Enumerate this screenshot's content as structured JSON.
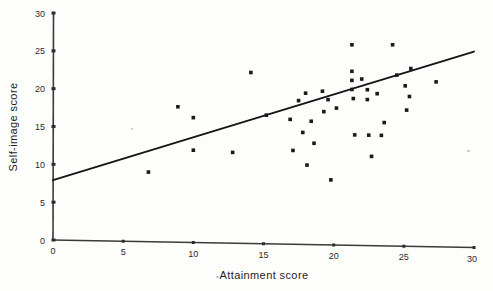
{
  "chart_data": {
    "type": "scatter",
    "title": "",
    "xlabel": "Attainment score",
    "ylabel": "Self-image score",
    "xlim": [
      0,
      30
    ],
    "ylim": [
      0,
      30
    ],
    "xticks": [
      0,
      5,
      10,
      15,
      20,
      25,
      30
    ],
    "yticks": [
      0,
      5,
      10,
      15,
      20,
      25,
      30
    ],
    "xtick_labels": [
      "0",
      "5",
      "10",
      "15",
      "20",
      "25",
      "30"
    ],
    "ytick_labels": [
      "0",
      "5",
      "10",
      "15",
      "20",
      "25",
      "30"
    ],
    "grid": false,
    "legend": null,
    "marker": "square",
    "points": [
      {
        "x": 6.8,
        "y": 9.2
      },
      {
        "x": 8.9,
        "y": 17.9
      },
      {
        "x": 10.0,
        "y": 16.5
      },
      {
        "x": 10.0,
        "y": 12.2
      },
      {
        "x": 12.8,
        "y": 12.0
      },
      {
        "x": 14.1,
        "y": 22.6
      },
      {
        "x": 15.2,
        "y": 17.0
      },
      {
        "x": 16.9,
        "y": 16.5
      },
      {
        "x": 17.1,
        "y": 12.4
      },
      {
        "x": 17.5,
        "y": 19.0
      },
      {
        "x": 17.8,
        "y": 14.8
      },
      {
        "x": 18.0,
        "y": 20.0
      },
      {
        "x": 18.1,
        "y": 10.5
      },
      {
        "x": 18.4,
        "y": 16.3
      },
      {
        "x": 18.6,
        "y": 13.4
      },
      {
        "x": 19.2,
        "y": 20.3
      },
      {
        "x": 19.3,
        "y": 17.6
      },
      {
        "x": 19.6,
        "y": 19.2
      },
      {
        "x": 19.8,
        "y": 8.6
      },
      {
        "x": 20.2,
        "y": 18.1
      },
      {
        "x": 21.3,
        "y": 26.5
      },
      {
        "x": 21.3,
        "y": 23.0
      },
      {
        "x": 21.3,
        "y": 21.8
      },
      {
        "x": 21.3,
        "y": 20.6
      },
      {
        "x": 21.4,
        "y": 19.4
      },
      {
        "x": 21.5,
        "y": 14.6
      },
      {
        "x": 22.0,
        "y": 22.0
      },
      {
        "x": 22.4,
        "y": 20.6
      },
      {
        "x": 22.4,
        "y": 19.3
      },
      {
        "x": 22.5,
        "y": 14.6
      },
      {
        "x": 22.7,
        "y": 11.8
      },
      {
        "x": 23.1,
        "y": 20.1
      },
      {
        "x": 23.4,
        "y": 14.6
      },
      {
        "x": 23.6,
        "y": 16.3
      },
      {
        "x": 24.2,
        "y": 26.6
      },
      {
        "x": 24.5,
        "y": 22.6
      },
      {
        "x": 25.1,
        "y": 21.2
      },
      {
        "x": 25.2,
        "y": 18.0
      },
      {
        "x": 25.4,
        "y": 19.8
      },
      {
        "x": 25.5,
        "y": 23.5
      },
      {
        "x": 27.3,
        "y": 21.8
      }
    ],
    "regression_line": {
      "x_start": 0,
      "y_start": 7.9,
      "x_end": 30,
      "y_end": 25.9
    }
  }
}
